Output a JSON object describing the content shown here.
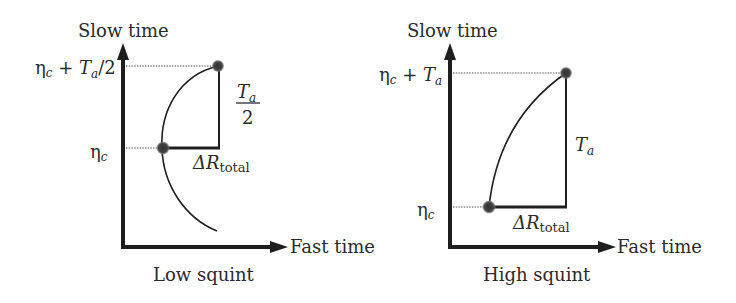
{
  "panels": [
    {
      "id": "low-squint",
      "caption": "Low squint",
      "y_axis_label": "Slow time",
      "x_axis_label": "Fast time",
      "top_tick": {
        "eta": "η",
        "sub": "c",
        "plus": " + ",
        "T": "T",
        "Tsub": "a",
        "suffix": "/2"
      },
      "bottom_tick": {
        "eta": "η",
        "sub": "c"
      },
      "vertical_span_label": {
        "num": "T",
        "num_sub": "a",
        "den": "2"
      },
      "horizontal_span_label": {
        "delta": "ΔR",
        "sub": "total"
      }
    },
    {
      "id": "high-squint",
      "caption": "High squint",
      "y_axis_label": "Slow time",
      "x_axis_label": "Fast time",
      "top_tick": {
        "eta": "η",
        "sub": "c",
        "plus": " + ",
        "T": "T",
        "Tsub": "a"
      },
      "bottom_tick": {
        "eta": "η",
        "sub": "c"
      },
      "vertical_span_label": {
        "T": "T",
        "sub": "a"
      },
      "horizontal_span_label": {
        "delta": "ΔR",
        "sub": "total"
      }
    }
  ],
  "colors": {
    "line": "#1e1e1e",
    "dot": "#3a3a3a",
    "text": "#2a2a2a"
  }
}
